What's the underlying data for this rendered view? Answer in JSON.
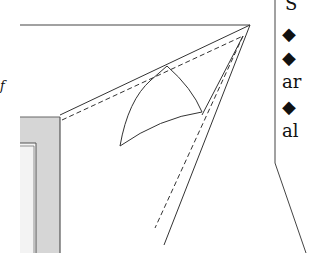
{
  "diagram": {
    "colors": {
      "line": "#333333",
      "frame_fill": "#d4d4d4",
      "frame_edge": "#555555",
      "background": "#ffffff"
    },
    "side_panel": {
      "lines": [
        "S",
        "◆",
        "◆",
        "ar",
        "◆",
        "al"
      ]
    },
    "left_fragment_text": "f"
  }
}
